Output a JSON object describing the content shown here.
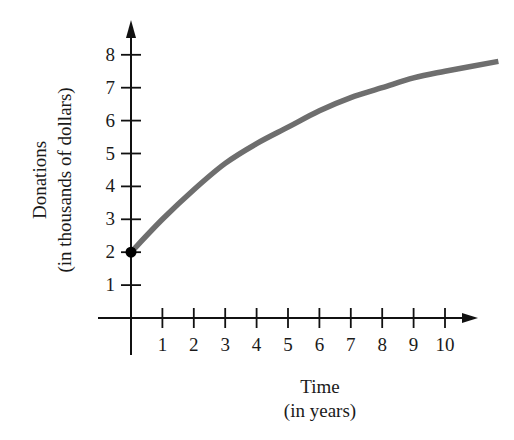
{
  "chart_data": {
    "type": "line",
    "title": "",
    "xlabel": "Time",
    "xlabel_sub": "(in years)",
    "ylabel": "Donations",
    "ylabel_sub": "(in thousands of dollars)",
    "xlim": [
      0,
      11.7
    ],
    "ylim": [
      0,
      8.6
    ],
    "x_ticks": [
      1,
      2,
      3,
      4,
      5,
      6,
      7,
      8,
      9,
      10
    ],
    "y_ticks": [
      1,
      2,
      3,
      4,
      5,
      6,
      7,
      8
    ],
    "grid": false,
    "legend": null,
    "series": [
      {
        "name": "Donations",
        "color": "#6e6e6e",
        "x": [
          0,
          1,
          2,
          3,
          4,
          5,
          6,
          7,
          8,
          9,
          10,
          11.7
        ],
        "values": [
          2.0,
          3.0,
          3.9,
          4.7,
          5.3,
          5.8,
          6.3,
          6.7,
          7.0,
          7.3,
          7.5,
          7.8
        ]
      }
    ],
    "annotations": [
      {
        "type": "point",
        "x": 0,
        "y": 2,
        "style": "filled-circle",
        "color": "#000000"
      }
    ]
  },
  "geometry": {
    "origin_px": [
      131,
      318
    ],
    "x_unit_px": 31.4,
    "y_unit_px": 32.9,
    "x_axis_start_px": 98,
    "x_axis_end_px": 478,
    "y_axis_top_px": 20,
    "y_axis_bottom_px": 355
  }
}
